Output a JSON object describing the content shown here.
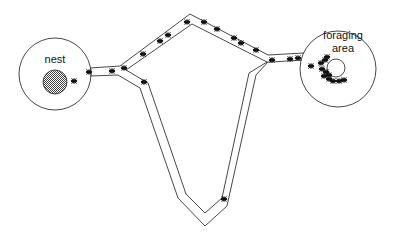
{
  "diagram": {
    "title": "",
    "nodes": [
      {
        "id": "nest",
        "label": "nest"
      },
      {
        "id": "foraging",
        "label_line1": "foraging",
        "label_line2": "area"
      }
    ],
    "edges": [
      {
        "from": "nest",
        "to": "foraging",
        "type": "short-path",
        "ants": "many"
      },
      {
        "from": "nest",
        "to": "foraging",
        "type": "long-path",
        "ants": "few"
      }
    ],
    "colors": {
      "stroke": "#333333",
      "ant": "#111111",
      "background": "#ffffff"
    }
  }
}
